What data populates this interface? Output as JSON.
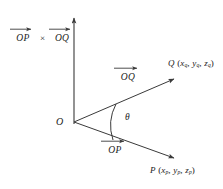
{
  "figure": {
    "background_color": "#ffffff",
    "stroke_color": "#3a3a3a",
    "text_color": "#1b1b1b"
  },
  "axis": {
    "name": "vertical-axis",
    "direction": "up",
    "x": 74,
    "y_top": 16,
    "y_bottom": 124
  },
  "origin": {
    "label": "O",
    "x": 74,
    "y": 122
  },
  "cross_product_label": {
    "first_vector": "OP",
    "operator": "×",
    "second_vector": "OQ"
  },
  "vectors": [
    {
      "name": "OQ",
      "label": "OQ",
      "from": [
        74,
        122
      ],
      "to": [
        176,
        78
      ],
      "point_label": {
        "point": "Q",
        "coords": [
          "x",
          "y",
          "z"
        ],
        "subscript": "q",
        "text": "Q (xₐ, yₐ, zₐ)"
      }
    },
    {
      "name": "OP",
      "label": "OP",
      "from": [
        74,
        122
      ],
      "to": [
        176,
        159
      ],
      "point_label": {
        "point": "P",
        "coords": [
          "x",
          "y",
          "z"
        ],
        "subscript": "p",
        "text": "P (xₚ, yₚ, zₚ)"
      }
    }
  ],
  "angle": {
    "symbol": "θ",
    "name": "theta",
    "between": [
      "OP",
      "OQ"
    ],
    "x": 126,
    "y": 118
  }
}
